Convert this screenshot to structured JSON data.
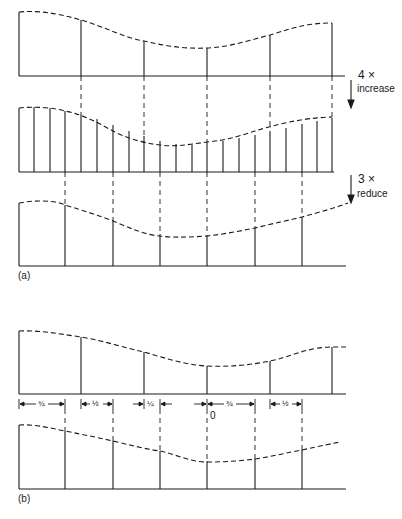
{
  "figure": {
    "panel_a": {
      "label": "(a)",
      "step1": {
        "factor": "4 ×",
        "action": "increase"
      },
      "step2": {
        "factor": "3 ×",
        "action": "reduce"
      },
      "original_samples": {
        "x": [
          19,
          81,
          144,
          207,
          270,
          332
        ],
        "heights": [
          64,
          56,
          35,
          28,
          41,
          53
        ],
        "base_y": 76
      },
      "upsampled_samples": {
        "count": 22,
        "x_start": 19,
        "x_end": 332,
        "base_y": 172
      },
      "downsampled_samples": {
        "x": [
          19,
          65,
          113,
          160,
          207,
          255,
          302
        ],
        "base_y": 266
      }
    },
    "panel_b": {
      "label": "(b)",
      "offset_labels": [
        "¾",
        "½",
        "¼",
        "0",
        "¾",
        "½"
      ],
      "original_samples": {
        "x": [
          19,
          81,
          144,
          207,
          270,
          332
        ],
        "base_y": 394
      },
      "resampled_samples": {
        "x": [
          19,
          65,
          113,
          160,
          207,
          255,
          302
        ],
        "base_y": 489
      }
    }
  }
}
